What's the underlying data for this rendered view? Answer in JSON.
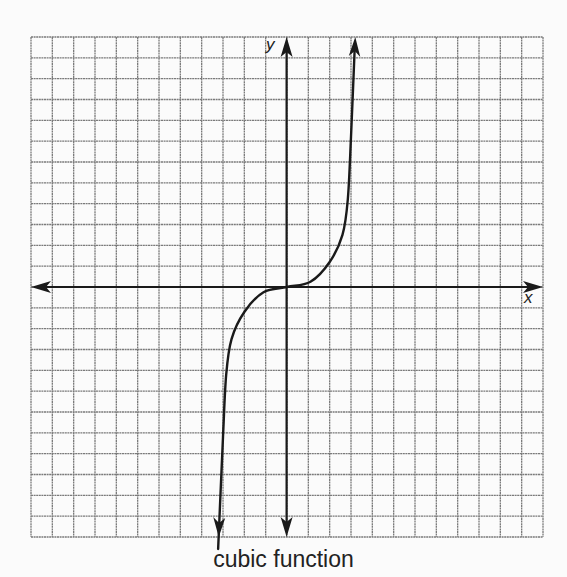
{
  "caption": "cubic function",
  "axes": {
    "x_label": "x",
    "y_label": "y"
  },
  "colors": {
    "grid": "#7a7a7a",
    "axis": "#1a1a1a",
    "curve": "#1a1a1a",
    "background": "#fbfbfb"
  },
  "chart_data": {
    "type": "line",
    "title": "cubic function",
    "xlabel": "x",
    "ylabel": "y",
    "grid": true,
    "grid_cells": {
      "columns": 24,
      "rows": 24
    },
    "xlim": [
      -12,
      12
    ],
    "ylim": [
      -12,
      12
    ],
    "tick_labels": [],
    "legend": null,
    "series": [
      {
        "name": "cubic function",
        "shape": "y ≈ k·x³ (hand-drawn, arrows on both ends)",
        "points": [
          [
            -3.2,
            -12
          ],
          [
            -3.0,
            -7.2
          ],
          [
            -2.85,
            -4.2
          ],
          [
            -2.6,
            -2.5
          ],
          [
            -2.0,
            -1.2
          ],
          [
            -1.1,
            -0.25
          ],
          [
            0,
            0
          ],
          [
            1.1,
            0.25
          ],
          [
            2.0,
            1.2
          ],
          [
            2.6,
            2.5
          ],
          [
            2.85,
            4.2
          ],
          [
            3.0,
            7.2
          ],
          [
            3.2,
            12
          ]
        ]
      }
    ]
  }
}
